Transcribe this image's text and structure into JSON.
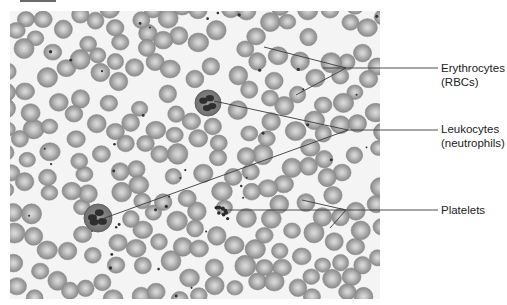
{
  "figure": {
    "labels": [
      {
        "id": "erythrocytes",
        "lines": [
          "Erythrocytes",
          "(RBCs)"
        ],
        "x": 441,
        "y": 61
      },
      {
        "id": "leukocytes",
        "lines": [
          "Leukocytes",
          "(neutrophils)"
        ],
        "x": 441,
        "y": 122
      },
      {
        "id": "platelets",
        "lines": [
          "Platelets"
        ],
        "x": 441,
        "y": 203
      }
    ],
    "leader_lines": {
      "color": "#3a3a3a",
      "erythrocytes": {
        "hub": [
          346,
          68
        ],
        "end": [
          438,
          68
        ],
        "targets": [
          [
            264,
            47
          ],
          [
            323,
            68
          ],
          [
            296,
            95
          ]
        ]
      },
      "leukocytes": {
        "hub": [
          348,
          130
        ],
        "end": [
          438,
          130
        ],
        "targets": [
          [
            214,
            101
          ],
          [
            102,
            219
          ]
        ]
      },
      "platelets": {
        "hub": [
          346,
          210
        ],
        "end": [
          438,
          210
        ],
        "start": [
          228,
          210
        ],
        "targets": [
          [
            302,
            200
          ],
          [
            330,
            228
          ]
        ]
      }
    },
    "neutrophils": [
      [
        98,
        218,
        14
      ],
      [
        208,
        103,
        13
      ]
    ],
    "platelet_cluster": [
      222,
      213
    ],
    "colors": {
      "rbc_edge": "#8e8e8e",
      "rbc_mid": "#a9a9a9",
      "rbc_center": "#d8d8d8",
      "nucleus": "#2e2e2e",
      "background": "#f4f4f4"
    }
  }
}
